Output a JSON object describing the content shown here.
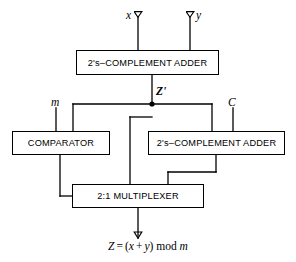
{
  "diagram": {
    "line_color": "#000000",
    "background": "#ffffff",
    "blocks": [
      {
        "id": "adder_top",
        "label": "2's–COMPLEMENT ADDER"
      },
      {
        "id": "comparator",
        "label": "COMPARATOR"
      },
      {
        "id": "adder_mod",
        "label": "2's–COMPLEMENT ADDER"
      },
      {
        "id": "multiplexer",
        "label": "2:1 MULTIPLEXER"
      }
    ],
    "signals": {
      "input_x": "x",
      "input_y": "y",
      "input_m": "m",
      "input_c": "C",
      "intermediate": "Z'"
    },
    "output": {
      "lhs": "Z",
      "equals": "=",
      "expr_open": "(",
      "operand_left": "x",
      "plus": "+",
      "operand_right": "y",
      "expr_close": ")",
      "mod": "mod",
      "modulus": "m"
    }
  }
}
